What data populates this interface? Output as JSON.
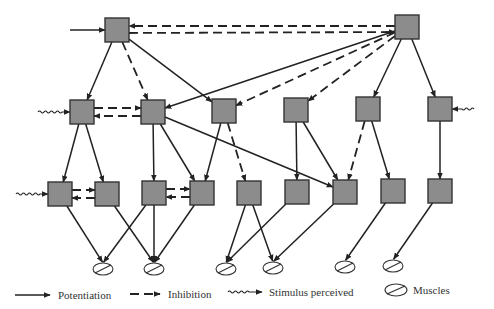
{
  "diagram": {
    "title": "",
    "nodes": [
      {
        "id": "T1",
        "row": 0,
        "x": 105,
        "y": 18
      },
      {
        "id": "T2",
        "row": 0,
        "x": 395,
        "y": 15
      },
      {
        "id": "A1",
        "row": 1,
        "x": 70,
        "y": 100
      },
      {
        "id": "A2",
        "row": 1,
        "x": 141,
        "y": 100
      },
      {
        "id": "A3",
        "row": 1,
        "x": 212,
        "y": 99
      },
      {
        "id": "A4",
        "row": 1,
        "x": 284,
        "y": 98
      },
      {
        "id": "A5",
        "row": 1,
        "x": 356,
        "y": 97
      },
      {
        "id": "A6",
        "row": 1,
        "x": 428,
        "y": 97
      },
      {
        "id": "B1",
        "row": 2,
        "x": 48,
        "y": 182
      },
      {
        "id": "B2",
        "row": 2,
        "x": 95,
        "y": 182
      },
      {
        "id": "B3",
        "row": 2,
        "x": 142,
        "y": 181
      },
      {
        "id": "B4",
        "row": 2,
        "x": 190,
        "y": 181
      },
      {
        "id": "B5",
        "row": 2,
        "x": 237,
        "y": 181
      },
      {
        "id": "B6",
        "row": 2,
        "x": 285,
        "y": 180
      },
      {
        "id": "B7",
        "row": 2,
        "x": 333,
        "y": 180
      },
      {
        "id": "B8",
        "row": 2,
        "x": 381,
        "y": 179
      },
      {
        "id": "B9",
        "row": 2,
        "x": 428,
        "y": 179
      }
    ],
    "muscles": [
      {
        "id": "M1",
        "x": 103,
        "y": 269
      },
      {
        "id": "M2",
        "x": 154,
        "y": 269
      },
      {
        "id": "M3",
        "x": 226,
        "y": 269
      },
      {
        "id": "M4",
        "x": 273,
        "y": 268
      },
      {
        "id": "M5",
        "x": 345,
        "y": 267
      },
      {
        "id": "M6",
        "x": 393,
        "y": 266
      }
    ],
    "edges": [
      {
        "from": "T1",
        "to": "A1",
        "type": "potentiation"
      },
      {
        "from": "T1",
        "to": "A2",
        "type": "inhibition"
      },
      {
        "from": "T1",
        "to": "A3",
        "type": "potentiation"
      },
      {
        "from": "T2",
        "to": "T1",
        "type": "inhibition"
      },
      {
        "from": "T1",
        "to": "T2",
        "type": "inhibition"
      },
      {
        "from": "T2",
        "to": "A2",
        "type": "potentiation"
      },
      {
        "from": "T2",
        "to": "A3",
        "type": "inhibition"
      },
      {
        "from": "T2",
        "to": "A4",
        "type": "inhibition"
      },
      {
        "from": "T2",
        "to": "A5",
        "type": "potentiation"
      },
      {
        "from": "T2",
        "to": "A6",
        "type": "potentiation"
      },
      {
        "from": "A1",
        "to": "A2",
        "type": "inhibition"
      },
      {
        "from": "A2",
        "to": "A1",
        "type": "inhibition"
      },
      {
        "from": "A1",
        "to": "B1",
        "type": "potentiation"
      },
      {
        "from": "A1",
        "to": "B2",
        "type": "potentiation"
      },
      {
        "from": "A2",
        "to": "B3",
        "type": "potentiation"
      },
      {
        "from": "A2",
        "to": "B4",
        "type": "potentiation"
      },
      {
        "from": "A2",
        "to": "B7",
        "type": "potentiation"
      },
      {
        "from": "A3",
        "to": "B4",
        "type": "potentiation"
      },
      {
        "from": "A3",
        "to": "B5",
        "type": "inhibition"
      },
      {
        "from": "A4",
        "to": "B6",
        "type": "potentiation"
      },
      {
        "from": "A4",
        "to": "B7",
        "type": "potentiation"
      },
      {
        "from": "A5",
        "to": "B7",
        "type": "inhibition"
      },
      {
        "from": "A5",
        "to": "B8",
        "type": "potentiation"
      },
      {
        "from": "A6",
        "to": "B9",
        "type": "potentiation"
      },
      {
        "from": "B1",
        "to": "B2",
        "type": "inhibition"
      },
      {
        "from": "B2",
        "to": "B1",
        "type": "inhibition"
      },
      {
        "from": "B3",
        "to": "B4",
        "type": "inhibition"
      },
      {
        "from": "B4",
        "to": "B3",
        "type": "inhibition"
      },
      {
        "from": "B1",
        "to": "M1",
        "type": "potentiation"
      },
      {
        "from": "B2",
        "to": "M2",
        "type": "potentiation"
      },
      {
        "from": "B3",
        "to": "M1",
        "type": "potentiation"
      },
      {
        "from": "B3",
        "to": "M2",
        "type": "potentiation"
      },
      {
        "from": "B4",
        "to": "M2",
        "type": "potentiation"
      },
      {
        "from": "B5",
        "to": "M3",
        "type": "potentiation"
      },
      {
        "from": "B5",
        "to": "M4",
        "type": "potentiation"
      },
      {
        "from": "B6",
        "to": "M3",
        "type": "potentiation"
      },
      {
        "from": "B7",
        "to": "M4",
        "type": "potentiation"
      },
      {
        "from": "B8",
        "to": "M5",
        "type": "potentiation"
      },
      {
        "from": "B9",
        "to": "M6",
        "type": "potentiation"
      }
    ],
    "inputs": [
      {
        "to": "T1",
        "type": "potentiation"
      },
      {
        "to": "A1",
        "type": "stimulus"
      },
      {
        "to": "A6",
        "type": "stimulus"
      },
      {
        "to": "B1",
        "type": "stimulus"
      }
    ]
  },
  "legend": {
    "potentiation": "Potentiation",
    "inhibition": "Inhibition",
    "stimulus": "Stimulus perceived",
    "muscles": "Muscles"
  },
  "colors": {
    "node_fill": "#8c8c8c",
    "node_stroke": "#333333",
    "edge": "#222222",
    "background": "#ffffff"
  }
}
